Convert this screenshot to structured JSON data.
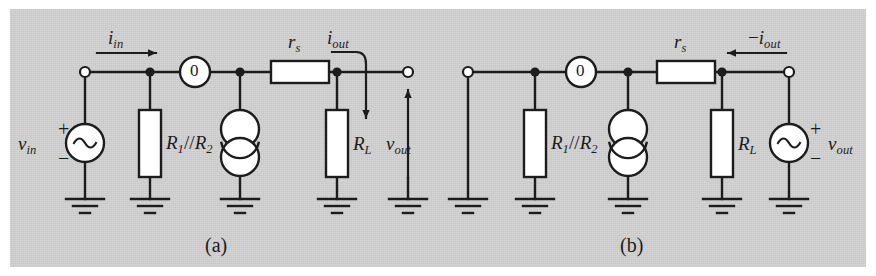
{
  "figure": {
    "width": 876,
    "height": 276,
    "background": "#ffffff",
    "paper_color": "#cfcfcf",
    "ink_color": "#1c1c1c",
    "component_fill": "#ffffff"
  },
  "captions": {
    "panel_a": "(a)",
    "panel_b": "(b)"
  },
  "circuit_a": {
    "labels": {
      "i_in": {
        "base": "i",
        "sub": "in"
      },
      "v_in": {
        "base": "v",
        "sub": "in"
      },
      "r_s": {
        "base": "r",
        "sub": "s"
      },
      "i_out": {
        "base": "i",
        "sub": "out"
      },
      "v_out": {
        "base": "v",
        "sub": "out"
      },
      "r_parallel": {
        "base": "R",
        "sub1": "1",
        "op": "//",
        "base2": "R",
        "sub2": "2"
      },
      "r_load": {
        "base": "R",
        "sub": "L"
      },
      "dependent_source_value": "0"
    },
    "signs": {
      "plus": "+",
      "minus": "−"
    },
    "components": [
      {
        "name": "input-terminal",
        "type": "open-terminal",
        "x": 85,
        "y": 72
      },
      {
        "name": "input-source",
        "type": "ac-voltage-source",
        "label": "v_in",
        "x": 85,
        "y": 143
      },
      {
        "name": "input-ground",
        "type": "ground",
        "x": 85,
        "y": 205
      },
      {
        "name": "bias-resistor",
        "type": "resistor",
        "label": "R_1//R_2",
        "x": 150,
        "y": 143
      },
      {
        "name": "bias-ground",
        "type": "ground",
        "x": 150,
        "y": 205
      },
      {
        "name": "dependent-source",
        "type": "controlled-current-source",
        "x": 240,
        "y": 143
      },
      {
        "name": "dependent-source-ground",
        "type": "ground",
        "x": 240,
        "y": 205
      },
      {
        "name": "zero-source",
        "type": "zero-voltage-source",
        "label": "0",
        "x": 195,
        "y": 72
      },
      {
        "name": "series-resistor",
        "type": "resistor",
        "label": "r_s",
        "x": 289,
        "y": 72
      },
      {
        "name": "load-resistor",
        "type": "resistor",
        "label": "R_L",
        "x": 337,
        "y": 143
      },
      {
        "name": "load-ground",
        "type": "ground",
        "x": 337,
        "y": 205
      },
      {
        "name": "output-terminal",
        "type": "open-terminal",
        "x": 408,
        "y": 72
      },
      {
        "name": "output-ground",
        "type": "ground",
        "x": 408,
        "y": 205
      }
    ],
    "arrows": [
      {
        "name": "i-in-arrow",
        "direction": "right",
        "from_x": 97,
        "to_x": 158,
        "y": 53
      },
      {
        "name": "i-out-arrow",
        "direction": "curved-down",
        "from_x": 337,
        "to_x": 364,
        "from_y": 52,
        "to_y": 122
      },
      {
        "name": "v-out-arrow",
        "direction": "up",
        "x": 408,
        "from_y": 198,
        "to_y": 86
      }
    ]
  },
  "circuit_b": {
    "labels": {
      "r_s": {
        "base": "r",
        "sub": "s"
      },
      "neg_i_out": {
        "sign": "−",
        "base": "i",
        "sub": "out"
      },
      "v_out": {
        "base": "v",
        "sub": "out"
      },
      "r_parallel": {
        "base": "R",
        "sub1": "1",
        "op": "//",
        "base2": "R",
        "sub2": "2"
      },
      "r_load": {
        "base": "R",
        "sub": "L"
      },
      "dependent_source_value": "0"
    },
    "signs": {
      "plus": "+",
      "minus": "−"
    },
    "components": [
      {
        "name": "input-terminal",
        "type": "open-terminal",
        "x": 468,
        "y": 72
      },
      {
        "name": "input-ground",
        "type": "ground",
        "x": 468,
        "y": 205
      },
      {
        "name": "bias-resistor",
        "type": "resistor",
        "label": "R_1//R_2",
        "x": 535,
        "y": 143
      },
      {
        "name": "bias-ground",
        "type": "ground",
        "x": 535,
        "y": 205
      },
      {
        "name": "dependent-source",
        "type": "controlled-current-source",
        "x": 628,
        "y": 143
      },
      {
        "name": "dependent-source-ground",
        "type": "ground",
        "x": 628,
        "y": 205
      },
      {
        "name": "zero-source",
        "type": "zero-voltage-source",
        "label": "0",
        "x": 581,
        "y": 72
      },
      {
        "name": "series-resistor",
        "type": "resistor",
        "label": "r_s",
        "x": 675,
        "y": 72
      },
      {
        "name": "load-resistor",
        "type": "resistor",
        "label": "R_L",
        "x": 722,
        "y": 143
      },
      {
        "name": "load-ground",
        "type": "ground",
        "x": 722,
        "y": 205
      },
      {
        "name": "output-terminal",
        "type": "open-terminal",
        "x": 789,
        "y": 72
      },
      {
        "name": "output-source",
        "type": "ac-voltage-source",
        "label": "v_out",
        "x": 789,
        "y": 143
      },
      {
        "name": "output-ground",
        "type": "ground",
        "x": 789,
        "y": 205
      }
    ],
    "arrows": [
      {
        "name": "neg-i-out-arrow",
        "direction": "left",
        "from_x": 786,
        "to_x": 726,
        "y": 53
      }
    ]
  }
}
